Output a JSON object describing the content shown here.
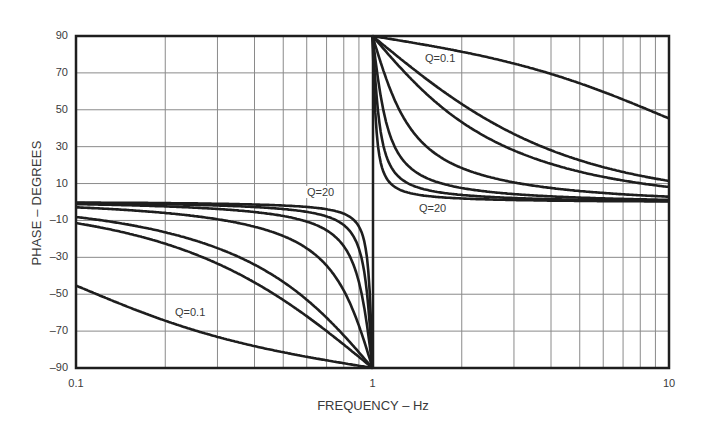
{
  "chart_data": {
    "type": "line",
    "title": "",
    "xlabel": "FREQUENCY – Hz",
    "ylabel": "PHASE – DEGREES",
    "xscale": "log",
    "xlim": [
      0.1,
      10
    ],
    "ylim": [
      -90,
      90
    ],
    "grid": true,
    "legend": "none (inline annotations)",
    "x_tick_labels": [
      "0.1",
      "1",
      "10"
    ],
    "y_tick_labels": [
      "90",
      "70",
      "50",
      "30",
      "10",
      "–10",
      "–30",
      "–50",
      "–70",
      "–90"
    ],
    "y_ticks": [
      90,
      70,
      50,
      30,
      10,
      -10,
      -30,
      -50,
      -70,
      -90
    ],
    "annotations": [
      {
        "text": "Q=20",
        "x": 0.8,
        "y": 3,
        "side": "left"
      },
      {
        "text": "Q=0.1",
        "x": 0.3,
        "y": -62,
        "side": "left"
      },
      {
        "text": "Q=0.1",
        "x": 1.6,
        "y": 80,
        "side": "right"
      },
      {
        "text": "Q=20",
        "x": 1.6,
        "y": -8,
        "side": "right"
      }
    ],
    "x": [
      0.1,
      0.2,
      0.5,
      0.8,
      0.9,
      0.99,
      1.01,
      1.1,
      1.25,
      2,
      5,
      10
    ],
    "series": [
      {
        "name": "Q=0.1",
        "q": 0.1,
        "values": [
          -45.3,
          -64.2,
          -81.5,
          -87.4,
          -88.8,
          -89.9,
          89.9,
          88.9,
          88.0,
          81.5,
          64.2,
          45.3
        ]
      },
      {
        "name": "Q=0.5",
        "q": 0.5,
        "values": [
          -11.4,
          -22.6,
          -53.1,
          -77.8,
          -83.3,
          -89.0,
          89.0,
          84.6,
          77.3,
          53.1,
          22.6,
          11.4
        ]
      },
      {
        "name": "Q=0.707",
        "q": 0.707,
        "values": [
          -8.1,
          -16.4,
          -43.3,
          -72.2,
          -80.7,
          -88.6,
          88.6,
          81.5,
          72.4,
          43.3,
          16.4,
          8.1
        ]
      },
      {
        "name": "Q=2",
        "q": 2,
        "values": [
          -2.9,
          -5.9,
          -18.4,
          -47.9,
          -64.6,
          -85.9,
          85.9,
          65.6,
          48.0,
          18.4,
          5.9,
          2.9
        ]
      },
      {
        "name": "Q=5",
        "q": 5,
        "values": [
          -1.2,
          -2.4,
          -7.6,
          -23.9,
          -40.4,
          -78.6,
          78.5,
          43.6,
          24.6,
          7.6,
          2.4,
          1.2
        ]
      },
      {
        "name": "Q=10",
        "q": 10,
        "values": [
          -0.6,
          -1.2,
          -3.8,
          -12.5,
          -22.9,
          -68.3,
          68.4,
          25.5,
          13.5,
          3.8,
          1.2,
          0.6
        ]
      },
      {
        "name": "Q=20",
        "q": 20,
        "values": [
          -0.3,
          -0.6,
          -1.9,
          -6.3,
          -12.1,
          -51.7,
          51.2,
          13.4,
          6.8,
          1.9,
          0.6,
          0.3
        ]
      }
    ],
    "colors": {
      "curve": "#1e1e1e",
      "grid": "#8a8a8a",
      "frame": "#1e1e1e"
    }
  }
}
